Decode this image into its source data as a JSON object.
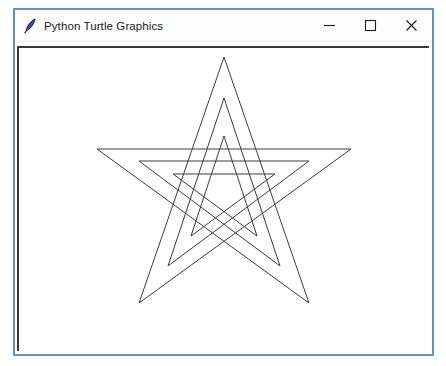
{
  "window": {
    "title": "Python Turtle Graphics",
    "icon": "python-feather-icon",
    "frame_color": "#5b94ce",
    "titlebar_color": "#fdfdfd",
    "canvas_background": "#ffffff",
    "canvas_border_color": "#3a3a3a"
  },
  "controls": {
    "minimize": {
      "name": "minimize-button",
      "glyph": "—",
      "tooltip": "Minimize"
    },
    "maximize": {
      "name": "maximize-button",
      "glyph": "□",
      "tooltip": "Maximize"
    },
    "close": {
      "name": "close-button",
      "glyph": "✕",
      "tooltip": "Close"
    }
  },
  "drawing": {
    "description": "Three nested five-pointed stars (pentagrams) drawn with turtle graphics",
    "shape": "pentagram",
    "star_count": 3,
    "stroke_color": "#3c3c3c",
    "stroke_width": 1,
    "fill": "none",
    "stars": [
      {
        "label": "outer-star",
        "points": "205,9 120,255 332,101 78,101 290,255"
      },
      {
        "label": "middle-star",
        "points": "205,50 149,218 290,113 120,113 261,218"
      },
      {
        "label": "inner-star",
        "points": "205,88 172,188 256,126 154,126 238,188"
      }
    ]
  }
}
